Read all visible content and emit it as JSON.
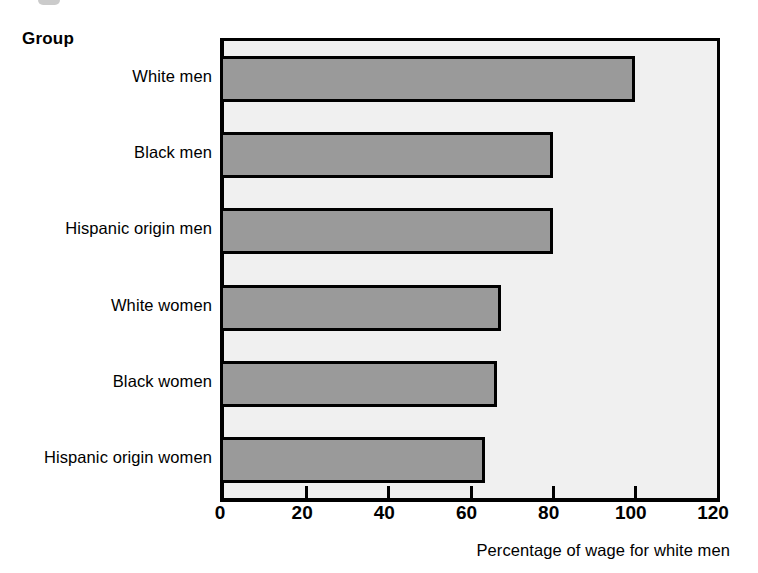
{
  "figure": {
    "group_axis_title": "Group",
    "xlabel": "Percentage of wage for white men"
  },
  "colors": {
    "bar_fill": "#9a9a9a",
    "bar_border": "#000000",
    "plot_background": "#f0f0f0",
    "page_background": "#ffffff",
    "text": "#000000"
  },
  "chart_data": {
    "type": "bar",
    "orientation": "horizontal",
    "title": "",
    "subtitle": "",
    "xlabel": "Percentage of wage for white men",
    "ylabel": "Group",
    "categories": [
      "White men",
      "Black men",
      "Hispanic origin men",
      "White women",
      "Black women",
      "Hispanic origin women"
    ],
    "values": [
      100,
      80,
      80,
      67.5,
      66.5,
      63.5
    ],
    "xlim": [
      0,
      120
    ],
    "xticks": [
      0,
      20,
      40,
      60,
      80,
      100,
      120
    ],
    "xtick_labels": [
      "0",
      "20",
      "40",
      "60",
      "80",
      "100",
      "120"
    ],
    "grid": false,
    "legend": false,
    "legend_position": "none",
    "data_labels": false
  }
}
